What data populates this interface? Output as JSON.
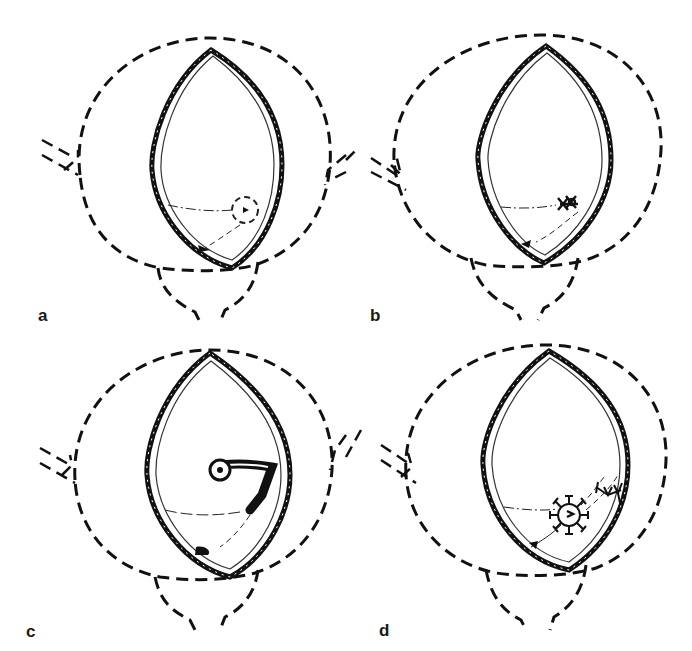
{
  "figure": {
    "panels": [
      {
        "id": "a",
        "label": "a",
        "detail": "dashed circle marking lesion near lower right wall"
      },
      {
        "id": "b",
        "label": "b",
        "detail": "lesion closed with cross-stitch sutures"
      },
      {
        "id": "c",
        "label": "c",
        "detail": "tubular catheter/stent inserted through lesion to wall"
      },
      {
        "id": "d",
        "label": "d",
        "detail": "star-shaped suture rosette around opening with branched suture at wall"
      }
    ]
  },
  "colors": {
    "ink": "#111111",
    "background": "#ffffff"
  }
}
